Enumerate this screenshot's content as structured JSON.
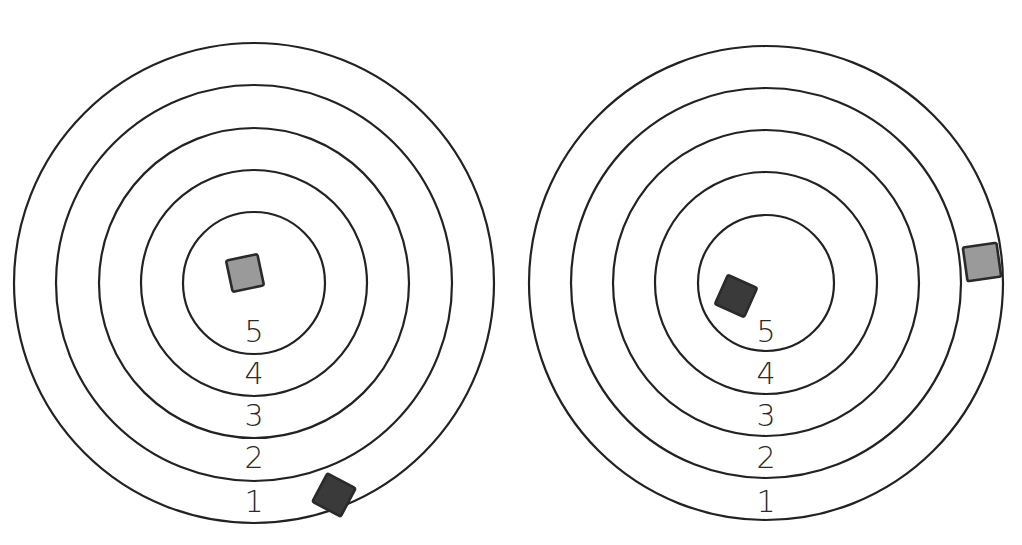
{
  "colors": {
    "ring_stroke": "#222222",
    "light_tile": "#9a9a9a",
    "dark_tile": "#3a3a3a",
    "background": "#ffffff"
  },
  "targets": [
    {
      "name": "left-target",
      "center": [
        254,
        283
      ],
      "ring_radii": [
        240,
        198,
        155,
        113,
        71
      ],
      "ring_labels": [
        {
          "text": "1",
          "y": 512
        },
        {
          "text": "2",
          "y": 468
        },
        {
          "text": "3",
          "y": 426
        },
        {
          "text": "4",
          "y": 384
        },
        {
          "text": "5",
          "y": 342
        }
      ],
      "tiles": [
        {
          "shade": "light",
          "cx": 245,
          "cy": 273,
          "size": 32,
          "rotate": -12,
          "ring_score": 5
        },
        {
          "shade": "dark",
          "cx": 334,
          "cy": 495,
          "size": 32,
          "rotate": 28,
          "ring_score": 1
        }
      ]
    },
    {
      "name": "right-target",
      "center": [
        766,
        283
      ],
      "ring_radii": [
        237,
        195,
        153,
        111,
        68
      ],
      "ring_labels": [
        {
          "text": "1",
          "y": 512
        },
        {
          "text": "2",
          "y": 468
        },
        {
          "text": "3",
          "y": 426
        },
        {
          "text": "4",
          "y": 384
        },
        {
          "text": "5",
          "y": 342
        }
      ],
      "tiles": [
        {
          "shade": "dark",
          "cx": 736,
          "cy": 296,
          "size": 32,
          "rotate": 24,
          "ring_score": 5
        },
        {
          "shade": "light",
          "cx": 982,
          "cy": 262,
          "size": 34,
          "rotate": -8,
          "ring_score": 1
        }
      ]
    }
  ]
}
